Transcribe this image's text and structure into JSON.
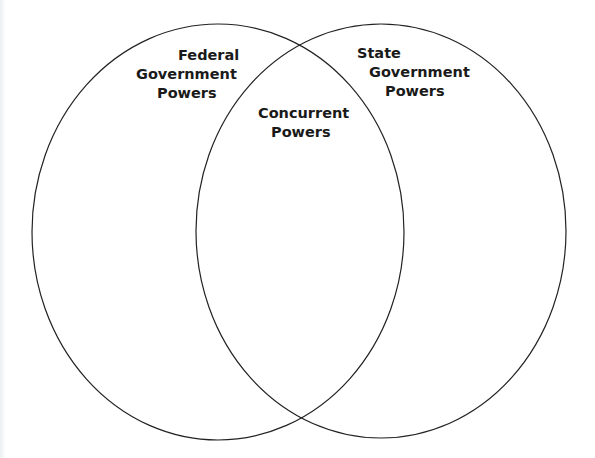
{
  "diagram": {
    "type": "venn",
    "sets": [
      {
        "id": "federal",
        "label_lines": [
          "Federal",
          "Government",
          "Powers"
        ]
      },
      {
        "id": "state",
        "label_lines": [
          "State",
          "Government",
          "Powers"
        ]
      }
    ],
    "intersection": {
      "id": "concurrent",
      "label_lines": [
        "Concurrent",
        "Powers"
      ]
    },
    "colors": {
      "stroke": "#222222",
      "background": "#ffffff",
      "text": "#1a1a1a"
    }
  }
}
